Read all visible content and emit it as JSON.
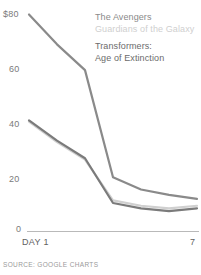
{
  "chart_data": {
    "type": "line",
    "title": "",
    "subtitle": "",
    "xlabel": "DAY 1",
    "ylabel": "",
    "x": [
      1,
      2,
      3,
      4,
      5,
      6,
      7
    ],
    "xlim": [
      1,
      7
    ],
    "ylim": [
      0,
      80
    ],
    "yticks": [
      0,
      20,
      40,
      60,
      80
    ],
    "ytick_labels": [
      "0",
      "20",
      "40",
      "60",
      "$80"
    ],
    "xtick_labels": [
      "DAY 1",
      "7"
    ],
    "grid": false,
    "legend_position": "top-right",
    "series": [
      {
        "name": "The Avengers",
        "color": "#8a8a8a",
        "values": [
          80,
          69,
          59.5,
          20,
          15.5,
          13.5,
          12
        ]
      },
      {
        "name": "Guardians of the Galaxy",
        "color": "#d0d0d0",
        "values": [
          40.5,
          33,
          26.5,
          11.5,
          9.5,
          8.5,
          9.5
        ]
      },
      {
        "name": "Transformers: Age of Extinction",
        "color": "#7b7b7b",
        "values": [
          41,
          33.5,
          27,
          10.5,
          8.5,
          7.5,
          8.5
        ]
      }
    ],
    "axis_color": "#b9b9b9",
    "source_note": "SOURCE: GOOGLE CHARTS"
  },
  "legend": {
    "items": [
      {
        "label": "The Avengers"
      },
      {
        "label": "Guardians of the Galaxy"
      },
      {
        "label_line1": "Transformers:",
        "label_line2": "Age of Extinction"
      }
    ]
  },
  "axis": {
    "y": {
      "t80": "$80",
      "t60": "60",
      "t40": "40",
      "t20": "20",
      "t0": "0"
    },
    "x": {
      "start": "DAY 1",
      "end": "7"
    }
  },
  "footer": {
    "source": "SOURCE: GOOGLE CHARTS"
  }
}
